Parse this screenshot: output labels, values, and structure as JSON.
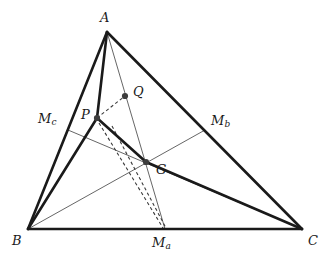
{
  "figure": {
    "kind": "euclidean-geometry-diagram",
    "background_color": "#ffffff",
    "stroke_color": "#1a1a1a",
    "thin_stroke_color": "#4a4a4a",
    "dash_color": "#3a3a3a",
    "dot_color": "#3d3d3d",
    "width": 331,
    "height": 264
  },
  "points": {
    "A": {
      "label": "A",
      "sub": "",
      "x": 107,
      "y": 32,
      "label_x": 100,
      "label_y": 11,
      "dot": false
    },
    "B": {
      "label": "B",
      "sub": "",
      "x": 28,
      "y": 229,
      "label_x": 12,
      "label_y": 234,
      "dot": false
    },
    "C": {
      "label": "C",
      "sub": "",
      "x": 302,
      "y": 229,
      "label_x": 308,
      "label_y": 234,
      "dot": false
    },
    "P": {
      "label": "P",
      "sub": "",
      "x": 97,
      "y": 118,
      "label_x": 81,
      "label_y": 108,
      "dot": true
    },
    "Q": {
      "label": "Q",
      "sub": "",
      "x": 125,
      "y": 96,
      "label_x": 133,
      "label_y": 85,
      "dot": true
    },
    "G": {
      "label": "G",
      "sub": "",
      "x": 146,
      "y": 162,
      "label_x": 156,
      "label_y": 163,
      "dot": true
    },
    "Ma": {
      "label": "M",
      "sub": "a",
      "x": 165,
      "y": 229,
      "label_x": 152,
      "label_y": 236,
      "dot": false
    },
    "Mb": {
      "label": "M",
      "sub": "b",
      "x": 205,
      "y": 130,
      "label_x": 211,
      "label_y": 114,
      "dot": false
    },
    "Mc": {
      "label": "M",
      "sub": "c",
      "x": 68,
      "y": 130,
      "label_x": 38,
      "label_y": 112,
      "dot": false
    }
  },
  "edges": {
    "outline": [
      {
        "name": "side-AB",
        "from": "A",
        "to": "B",
        "style": "thick"
      },
      {
        "name": "side-BC",
        "from": "B",
        "to": "C",
        "style": "thick"
      },
      {
        "name": "side-CA",
        "from": "C",
        "to": "A",
        "style": "thick"
      }
    ],
    "inner_thick": [
      {
        "name": "segment-AP",
        "from": "A",
        "to": "P",
        "style": "thick"
      },
      {
        "name": "segment-PB",
        "from": "P",
        "to": "B",
        "style": "thick"
      },
      {
        "name": "segment-PG",
        "from": "P",
        "to": "G",
        "style": "thick"
      },
      {
        "name": "segment-GC",
        "from": "G",
        "to": "C",
        "style": "thick"
      }
    ],
    "medians": [
      {
        "name": "median-A-Ma",
        "from": "A",
        "to": "Ma",
        "style": "thin"
      },
      {
        "name": "median-B-Mb",
        "from": "B",
        "to": "Mb",
        "style": "thin"
      },
      {
        "name": "median-C-Mc",
        "from": "C",
        "to": "Mc",
        "style": "thin"
      }
    ],
    "dashed": [
      {
        "name": "dashed-P-Q",
        "from": "P",
        "to": "Q",
        "style": "dashed"
      },
      {
        "name": "dashed-Q-Ma",
        "from": "Q",
        "to": "Ma",
        "style": "dashed"
      },
      {
        "name": "dashed-P-Ma",
        "from": "P",
        "to": "Ma",
        "style": "dashed"
      }
    ]
  },
  "labels_order": [
    "A",
    "Mc",
    "P",
    "Q",
    "Mb",
    "G",
    "B",
    "Ma",
    "C"
  ]
}
